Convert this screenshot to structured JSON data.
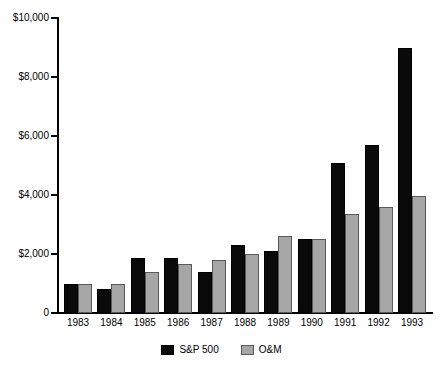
{
  "chart_data": {
    "type": "bar",
    "title": "",
    "subtitle": "",
    "xlabel": "",
    "ylabel": "",
    "categories": [
      "1983",
      "1984",
      "1985",
      "1986",
      "1987",
      "1988",
      "1989",
      "1990",
      "1991",
      "1992",
      "1993"
    ],
    "series": [
      {
        "name": "S&P 500",
        "color": "#0a0a0a",
        "values": [
          1000,
          800,
          1850,
          1850,
          1400,
          2300,
          2100,
          2500,
          5100,
          5700,
          9000
        ]
      },
      {
        "name": "O&M",
        "color": "#a6a6a6",
        "values": [
          1000,
          1000,
          1400,
          1650,
          1800,
          2000,
          2600,
          2500,
          3350,
          3600,
          3950
        ]
      }
    ],
    "ylim": [
      0,
      10000
    ],
    "ytick_values": [
      0,
      2000,
      4000,
      6000,
      8000,
      10000
    ],
    "ytick_labels": [
      "0",
      "$2,000",
      "$4,000",
      "$6,000",
      "$8,000",
      "$10,000"
    ],
    "grid": false,
    "legend_position": "bottom"
  },
  "legend": {
    "items": [
      {
        "label": "S&P 500",
        "swatch": "black-square-swatch"
      },
      {
        "label": "O&M",
        "swatch": "gray-square-swatch"
      }
    ]
  }
}
